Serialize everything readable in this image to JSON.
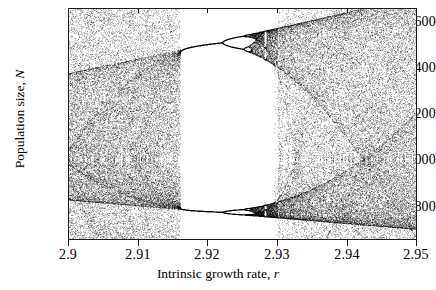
{
  "chart_data": {
    "type": "scatter",
    "title": "",
    "xlabel": "Intrinsic growth rate, r",
    "ylabel": "Population size, N",
    "xlim": [
      2.9,
      2.95
    ],
    "ylim": [
      640,
      1680
    ],
    "xticks": [
      "2.9",
      "2.91",
      "2.92",
      "2.93",
      "2.94",
      "2.95"
    ],
    "xtick_values": [
      2.9,
      2.91,
      2.92,
      2.93,
      2.94,
      2.95
    ],
    "yticks": [
      "800",
      "1000",
      "1200",
      "1400",
      "1600"
    ],
    "ytick_values": [
      800,
      1000,
      1200,
      1400,
      1600
    ],
    "grid": false,
    "legend": null,
    "marker": "point",
    "marker_color": "#000000",
    "model": {
      "equation": "N_t+1 = N_t * exp(r * (1 - N_t / K))",
      "carrying_capacity": 1000,
      "transient_iterations": 300,
      "plotted_iterations": 260,
      "r_samples": 700
    },
    "features": [
      {
        "name": "chaotic-band-left",
        "r_range": [
          2.9,
          2.9158
        ],
        "N_range": [
          650,
          1660
        ]
      },
      {
        "name": "period-2-window",
        "r_range": [
          2.9158,
          2.9298
        ],
        "upper_branch_N": [
          1490,
          1560
        ],
        "lower_branch_N": [
          790,
          765
        ]
      },
      {
        "name": "period-4-onset",
        "r": 2.9237
      },
      {
        "name": "period-doubling-cascade",
        "r_range": [
          2.9237,
          2.9298
        ]
      },
      {
        "name": "chaotic-band-right",
        "r_range": [
          2.9298,
          2.95
        ],
        "N_range": [
          645,
          1680
        ]
      }
    ]
  },
  "figure": {
    "plot_area": {
      "left": 68,
      "top": 8,
      "width": 349,
      "height": 232
    },
    "frame_color": "#1a1a1a",
    "background": "#ffffff"
  }
}
